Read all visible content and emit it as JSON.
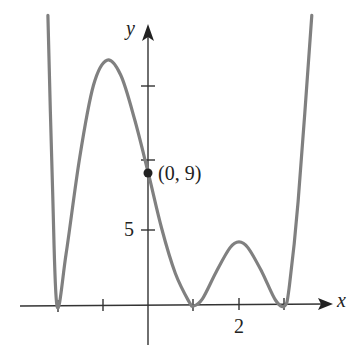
{
  "chart_data": {
    "type": "line",
    "title": "",
    "xlabel": "x",
    "ylabel": "y",
    "x_tick_labels": [
      {
        "value": 2,
        "label": "2"
      }
    ],
    "y_tick_labels": [
      {
        "value": 5,
        "label": "5"
      }
    ],
    "x_ticks": [
      -2,
      -1,
      1,
      2,
      3
    ],
    "y_ticks": [
      5,
      10,
      15
    ],
    "xlim": [
      -3.1,
      4.2
    ],
    "ylim": [
      -2.3,
      20
    ],
    "grid": false,
    "legend": null,
    "series": [
      {
        "name": "f(x)",
        "color": "#808080",
        "x": [
          -2.2,
          -2.1,
          -2.0,
          -1.8,
          -1.5,
          -1.2,
          -0.9,
          -0.6,
          -0.3,
          0.0,
          0.3,
          0.6,
          0.9,
          1.0,
          1.2,
          1.5,
          1.8,
          2.0,
          2.2,
          2.5,
          2.8,
          3.0,
          3.1,
          3.3,
          3.6
        ],
        "y": [
          19.5,
          8.0,
          0.0,
          3.5,
          10.0,
          14.8,
          16.5,
          15.5,
          12.6,
          9.0,
          5.2,
          2.2,
          0.3,
          0.0,
          0.5,
          2.3,
          3.9,
          4.3,
          3.9,
          2.3,
          0.4,
          0.0,
          1.2,
          7.0,
          19.5
        ]
      }
    ],
    "annotations": [
      {
        "type": "point",
        "x": 0,
        "y": 9,
        "label": "(0, 9)"
      }
    ]
  },
  "labels": {
    "x_axis": "x",
    "y_axis": "y",
    "x_tick_2": "2",
    "y_tick_5": "5",
    "point": "(0, 9)"
  }
}
